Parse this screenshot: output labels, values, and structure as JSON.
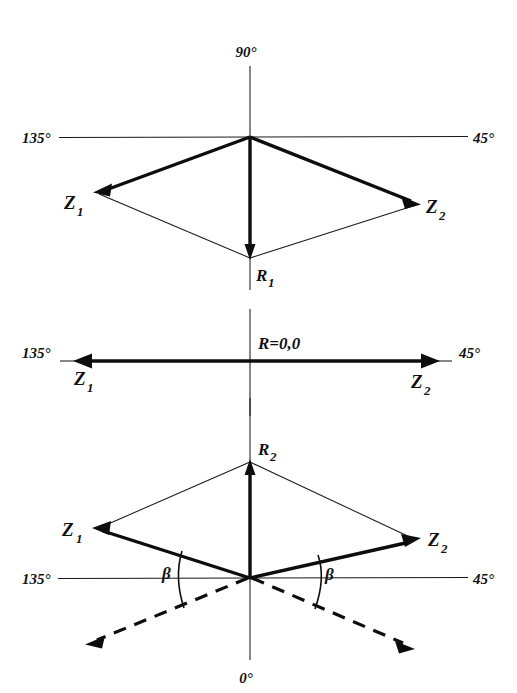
{
  "figure": {
    "background_color": "#ffffff",
    "ink_color": "#0d0d0d",
    "width": 517,
    "height": 693
  },
  "panels": [
    {
      "id": "panel-top",
      "name": "resultant-r1-downward",
      "axis_labels": {
        "top": "90°",
        "left": "135°",
        "right": "45°"
      },
      "vectors": [
        {
          "name": "Z1",
          "label": "Z",
          "sub": "1",
          "direction": "down-left"
        },
        {
          "name": "Z2",
          "label": "Z",
          "sub": "2",
          "direction": "down-right"
        },
        {
          "name": "R1",
          "label": "R",
          "sub": "1",
          "direction": "down"
        }
      ]
    },
    {
      "id": "panel-middle",
      "name": "resultant-zero",
      "axis_labels": {
        "left": "135°",
        "right": "45°"
      },
      "resultant_label": "R=0,0",
      "vectors": [
        {
          "name": "Z1",
          "label": "Z",
          "sub": "1",
          "direction": "left"
        },
        {
          "name": "Z2",
          "label": "Z",
          "sub": "2",
          "direction": "right"
        }
      ]
    },
    {
      "id": "panel-bottom",
      "name": "resultant-r2-upward",
      "axis_labels": {
        "left": "135°",
        "right": "45°",
        "bottom": "0°"
      },
      "angle_label": "β",
      "vectors": [
        {
          "name": "Z1",
          "label": "Z",
          "sub": "1",
          "direction": "up-left"
        },
        {
          "name": "Z2",
          "label": "Z",
          "sub": "2",
          "direction": "up-right"
        },
        {
          "name": "R2",
          "label": "R",
          "sub": "2",
          "direction": "up"
        }
      ]
    }
  ],
  "labels": {
    "deg90": "90°",
    "deg135": "135°",
    "deg45": "45°",
    "deg0": "0°",
    "z": "Z",
    "r": "R",
    "sub1": "1",
    "sub2": "2",
    "r_zero": "R=0,0",
    "beta": "β"
  }
}
